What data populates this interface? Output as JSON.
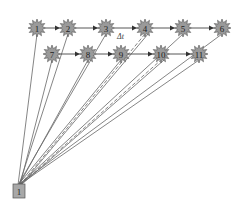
{
  "diagram": {
    "type": "directed-graph",
    "source": {
      "id": "1",
      "label": "1",
      "shape": "square",
      "x": 19,
      "y": 191
    },
    "edge_label": {
      "text": "Δt",
      "x": 117,
      "y": 39
    },
    "colors": {
      "node_fill": "#9a9a9a",
      "node_stroke": "#555555",
      "edge": "#666666",
      "source_fill": "#a8a8a8"
    },
    "nodes": [
      {
        "id": "1",
        "label": "1",
        "x": 37,
        "y": 28,
        "row": 1
      },
      {
        "id": "2",
        "label": "2",
        "x": 68,
        "y": 28,
        "row": 1
      },
      {
        "id": "3",
        "label": "3",
        "x": 106,
        "y": 28,
        "row": 1
      },
      {
        "id": "4",
        "label": "4",
        "x": 145,
        "y": 28,
        "row": 1
      },
      {
        "id": "5",
        "label": "5",
        "x": 183,
        "y": 28,
        "row": 1
      },
      {
        "id": "6",
        "label": "6",
        "x": 222,
        "y": 28,
        "row": 1
      },
      {
        "id": "7",
        "label": "7",
        "x": 52,
        "y": 54,
        "row": 2
      },
      {
        "id": "8",
        "label": "8",
        "x": 88,
        "y": 54,
        "row": 2
      },
      {
        "id": "9",
        "label": "9",
        "x": 121,
        "y": 54,
        "row": 2
      },
      {
        "id": "10",
        "label": "10",
        "x": 161,
        "y": 54,
        "row": 2
      },
      {
        "id": "11",
        "label": "11",
        "x": 199,
        "y": 54,
        "row": 2
      }
    ],
    "arrows": [
      {
        "from": "1",
        "to": "2"
      },
      {
        "from": "2",
        "to": "3"
      },
      {
        "from": "3",
        "to": "4"
      },
      {
        "from": "4",
        "to": "5"
      },
      {
        "from": "5",
        "to": "6"
      },
      {
        "from": "7",
        "to": "8"
      },
      {
        "from": "8",
        "to": "9"
      },
      {
        "from": "9",
        "to": "10"
      },
      {
        "from": "10",
        "to": "11"
      }
    ],
    "source_links": [
      {
        "to": "1",
        "dashed": false
      },
      {
        "to": "2",
        "dashed": false
      },
      {
        "to": "7",
        "dashed": false
      },
      {
        "to": "3",
        "dashed": false
      },
      {
        "to": "8",
        "dashed": false
      },
      {
        "to": "4",
        "dashed": true
      },
      {
        "to": "9",
        "dashed": false
      },
      {
        "to": "5",
        "dashed": false
      },
      {
        "to": "10",
        "dashed": true
      },
      {
        "to": "6",
        "dashed": false
      },
      {
        "to": "11",
        "dashed": false
      }
    ]
  }
}
